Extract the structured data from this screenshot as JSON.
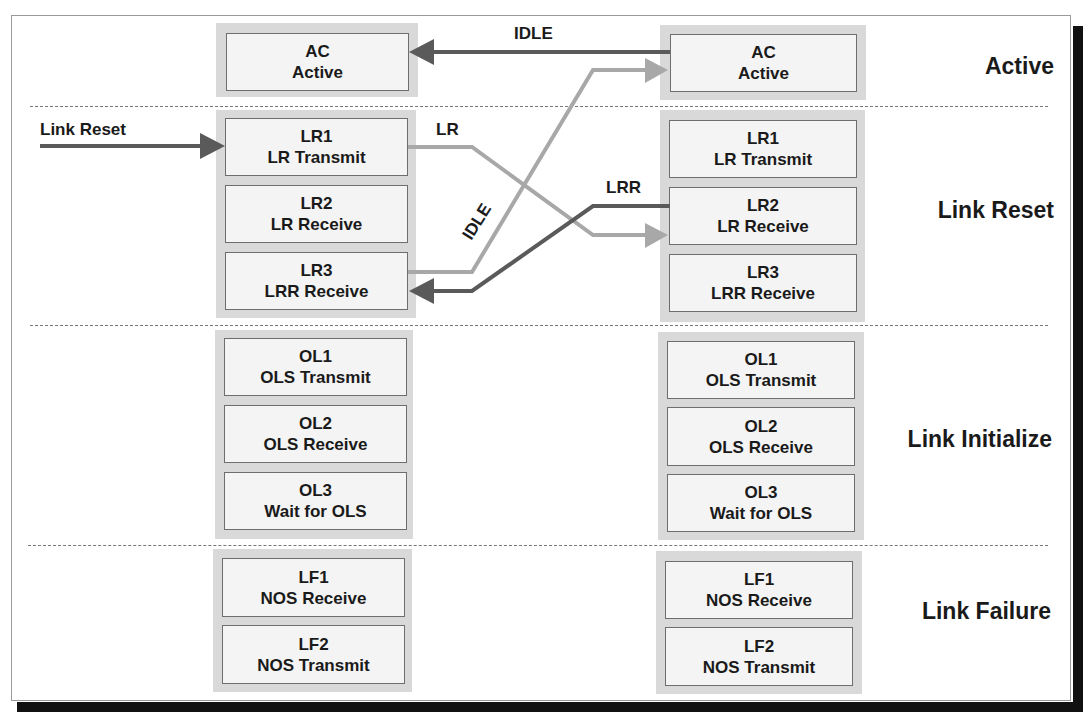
{
  "colors": {
    "dark_arrow": "#5a5a5a",
    "light_arrow": "#a8a8a8",
    "group_bg": "#d9d9d9",
    "box_bg": "#f4f4f4"
  },
  "sections": [
    {
      "label": "Active"
    },
    {
      "label": "Link Reset"
    },
    {
      "label": "Link Initialize"
    },
    {
      "label": "Link Failure"
    }
  ],
  "left_port": {
    "active": [
      {
        "code": "AC",
        "name": "Active"
      }
    ],
    "link_reset": [
      {
        "code": "LR1",
        "name": "LR Transmit"
      },
      {
        "code": "LR2",
        "name": "LR Receive"
      },
      {
        "code": "LR3",
        "name": "LRR Receive"
      }
    ],
    "link_initialize": [
      {
        "code": "OL1",
        "name": "OLS Transmit"
      },
      {
        "code": "OL2",
        "name": "OLS Receive"
      },
      {
        "code": "OL3",
        "name": "Wait for OLS"
      }
    ],
    "link_failure": [
      {
        "code": "LF1",
        "name": "NOS Receive"
      },
      {
        "code": "LF2",
        "name": "NOS Transmit"
      }
    ]
  },
  "right_port": {
    "active": [
      {
        "code": "AC",
        "name": "Active"
      }
    ],
    "link_reset": [
      {
        "code": "LR1",
        "name": "LR Transmit"
      },
      {
        "code": "LR2",
        "name": "LR Receive"
      },
      {
        "code": "LR3",
        "name": "LRR Receive"
      }
    ],
    "link_initialize": [
      {
        "code": "OL1",
        "name": "OLS Transmit"
      },
      {
        "code": "OL2",
        "name": "OLS Receive"
      },
      {
        "code": "OL3",
        "name": "Wait for OLS"
      }
    ],
    "link_failure": [
      {
        "code": "LF1",
        "name": "NOS Receive"
      },
      {
        "code": "LF2",
        "name": "NOS Transmit"
      }
    ]
  },
  "arrows": {
    "link_reset_input": {
      "label": "Link Reset",
      "from": "external",
      "to": "left.LR1"
    },
    "lr": {
      "label": "LR",
      "from": "left.LR1",
      "to": "right.LR2"
    },
    "lrr": {
      "label": "LRR",
      "from": "right.LR2",
      "to": "left.LR3"
    },
    "idle_diagonal": {
      "label": "IDLE",
      "from": "left.LR3",
      "to": "right.AC"
    },
    "idle_top": {
      "label": "IDLE",
      "from": "right.AC",
      "to": "left.AC"
    }
  }
}
